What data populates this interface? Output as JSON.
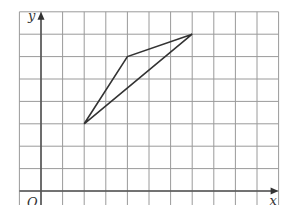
{
  "diagram": {
    "type": "coordinate-grid",
    "grid": {
      "x_min": -1,
      "x_max": 11,
      "y_min": -1,
      "y_max": 8,
      "origin_px": [
        41,
        191
      ],
      "unit_px_x": 21.6,
      "unit_px_y": 22.4,
      "line_color": "#9a9a9a"
    },
    "axes": {
      "x_label": "x",
      "y_label": "y",
      "origin_label": "O",
      "color": "#555555"
    },
    "shape": {
      "type": "triangle",
      "vertices": [
        {
          "x": 2,
          "y": 3
        },
        {
          "x": 4,
          "y": 6
        },
        {
          "x": 7,
          "y": 7
        }
      ],
      "stroke": "#333333"
    }
  }
}
